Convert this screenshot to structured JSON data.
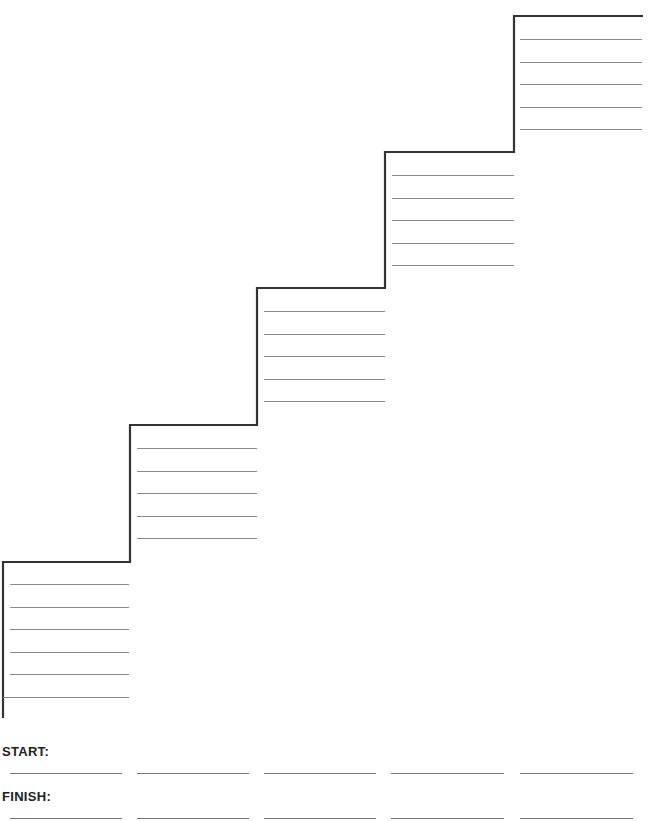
{
  "worksheet": {
    "type": "staircase goal-setting worksheet",
    "steps": [
      {
        "step": 1,
        "lines": 6
      },
      {
        "step": 2,
        "lines": 5
      },
      {
        "step": 3,
        "lines": 5
      },
      {
        "step": 4,
        "lines": 5
      },
      {
        "step": 5,
        "lines": 5
      }
    ]
  },
  "footer": {
    "start_label": "START:",
    "finish_label": "FINISH:",
    "blanks_per_row": 5
  },
  "colors": {
    "stair_outline": "#333333",
    "writing_lines": "#8a8a8a"
  }
}
